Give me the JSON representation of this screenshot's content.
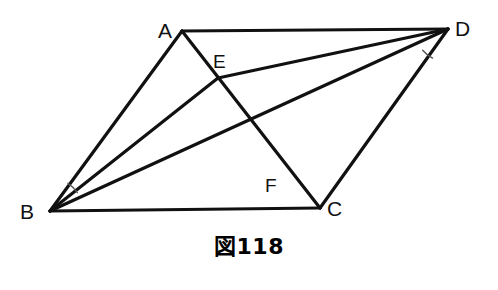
{
  "figure": {
    "caption": "図118",
    "canvas": {
      "width": 498,
      "height": 290
    },
    "style": {
      "line_color": "#111111",
      "line_width": 3.2,
      "arc_color": "#555555",
      "arc_width": 1.4,
      "background": "#ffffff"
    },
    "points": {
      "A": {
        "label": "A",
        "x": 182,
        "y": 31,
        "label_x": 158,
        "label_y": 20
      },
      "B": {
        "label": "B",
        "x": 50,
        "y": 211,
        "label_x": 20,
        "label_y": 201
      },
      "C": {
        "label": "C",
        "x": 320,
        "y": 208,
        "label_x": 327,
        "label_y": 198
      },
      "D": {
        "label": "D",
        "x": 448,
        "y": 29,
        "label_x": 455,
        "label_y": 18
      },
      "E": {
        "label": "E",
        "x": 218,
        "y": 78,
        "label_x": 213,
        "label_y": 52
      },
      "F": {
        "label": "F",
        "x": 285,
        "y": 163,
        "label_x": 265,
        "label_y": 176
      }
    },
    "segments": [
      {
        "name": "segment-AD",
        "from": "A",
        "to": "D"
      },
      {
        "name": "segment-AB",
        "from": "A",
        "to": "B"
      },
      {
        "name": "segment-BC",
        "from": "B",
        "to": "C"
      },
      {
        "name": "segment-CD",
        "from": "C",
        "to": "D"
      },
      {
        "name": "segment-AC",
        "from": "A",
        "to": "C"
      },
      {
        "name": "segment-BD",
        "from": "B",
        "to": "D"
      },
      {
        "name": "segment-BE-D",
        "from": "B",
        "to": "D",
        "via": "E"
      },
      {
        "name": "segment-DE",
        "from": "D",
        "to": "E"
      }
    ],
    "angle_marks": [
      {
        "name": "angle-mark-B",
        "vertex": "B",
        "radius": 33,
        "from_deg": -57,
        "to_deg": -34
      },
      {
        "name": "angle-mark-D",
        "vertex": "D",
        "radius": 33,
        "from_deg": 140,
        "to_deg": 118
      }
    ]
  }
}
